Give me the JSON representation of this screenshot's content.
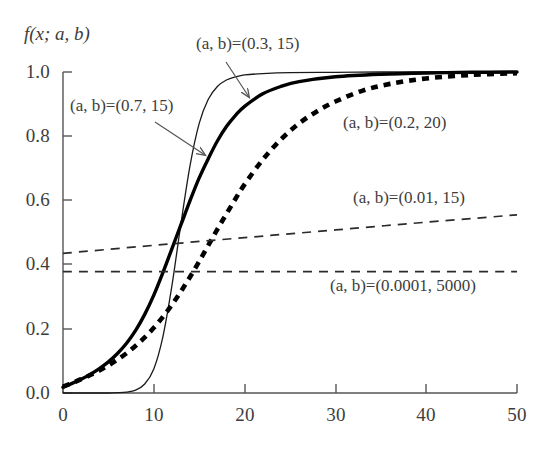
{
  "chart_data": {
    "type": "line",
    "title": "",
    "ylabel": "f(x; a, b)",
    "xlabel": "",
    "xlim": [
      0,
      50
    ],
    "ylim": [
      0.0,
      1.0
    ],
    "grid": false,
    "legend_position": "inline-annotations",
    "xticks": [
      "0",
      "10",
      "20",
      "30",
      "40",
      "50"
    ],
    "xtick_values": [
      0,
      10,
      20,
      30,
      40,
      50
    ],
    "yticks": [
      "0.0",
      "0.2",
      "0.4",
      "0.6",
      "0.8",
      "1.0"
    ],
    "ytick_values": [
      0.0,
      0.2,
      0.4,
      0.6,
      0.8,
      1.0
    ],
    "series": [
      {
        "name": "(a, b)=(0.7, 15)",
        "style": "thin-solid",
        "color": "#1a1a1a",
        "a": 0.7,
        "b": 15,
        "x": [
          0,
          1,
          2,
          3,
          4,
          5,
          6,
          7,
          8,
          9,
          10,
          11,
          12,
          13,
          14,
          15,
          16,
          17,
          18,
          19,
          20,
          22,
          25,
          30,
          35,
          40,
          45,
          50
        ],
        "y": [
          0.0,
          0.0,
          0.0,
          0.0,
          0.0,
          0.0,
          0.001,
          0.003,
          0.009,
          0.028,
          0.075,
          0.175,
          0.335,
          0.53,
          0.71,
          0.84,
          0.915,
          0.955,
          0.975,
          0.985,
          0.991,
          0.995,
          0.998,
          0.999,
          1.0,
          1.0,
          1.0,
          1.0
        ]
      },
      {
        "name": "(a, b)=(0.3, 15)",
        "style": "thick-solid",
        "color": "#000000",
        "a": 0.3,
        "b": 15,
        "x": [
          0,
          1,
          2,
          3,
          4,
          5,
          6,
          7,
          8,
          9,
          10,
          11,
          12,
          13,
          14,
          15,
          16,
          17,
          18,
          19,
          20,
          22,
          24,
          26,
          30,
          35,
          40,
          45,
          50
        ],
        "y": [
          0.018,
          0.03,
          0.043,
          0.058,
          0.076,
          0.097,
          0.123,
          0.155,
          0.195,
          0.245,
          0.305,
          0.375,
          0.45,
          0.525,
          0.6,
          0.67,
          0.73,
          0.785,
          0.83,
          0.865,
          0.893,
          0.932,
          0.955,
          0.97,
          0.985,
          0.993,
          0.997,
          0.999,
          1.0
        ]
      },
      {
        "name": "(a, b)=(0.2, 20)",
        "style": "thick-dashed",
        "color": "#000000",
        "a": 0.2,
        "b": 20,
        "x": [
          0,
          1,
          2,
          3,
          4,
          5,
          6,
          7,
          8,
          9,
          10,
          11,
          12,
          13,
          14,
          15,
          16,
          17,
          18,
          19,
          20,
          22,
          24,
          26,
          28,
          30,
          33,
          36,
          40,
          45,
          50
        ],
        "y": [
          0.02,
          0.031,
          0.043,
          0.056,
          0.07,
          0.086,
          0.104,
          0.124,
          0.147,
          0.173,
          0.203,
          0.237,
          0.275,
          0.317,
          0.362,
          0.41,
          0.46,
          0.51,
          0.558,
          0.605,
          0.65,
          0.727,
          0.79,
          0.84,
          0.878,
          0.908,
          0.942,
          0.963,
          0.98,
          0.991,
          0.996
        ]
      },
      {
        "name": "(a, b)=(0.01, 15)",
        "style": "thin-dashed",
        "color": "#2b2b2b",
        "a": 0.01,
        "b": 15,
        "x": [
          0,
          10,
          20,
          30,
          40,
          50
        ],
        "y": [
          0.435,
          0.46,
          0.484,
          0.508,
          0.532,
          0.555
        ]
      },
      {
        "name": "(a, b)=(0.0001, 5000)",
        "style": "thin-dashed",
        "color": "#2b2b2b",
        "a": 0.0001,
        "b": 5000,
        "x": [
          0,
          10,
          20,
          30,
          40,
          50
        ],
        "y": [
          0.378,
          0.378,
          0.378,
          0.378,
          0.378,
          0.378
        ]
      }
    ],
    "annotations": [
      {
        "id": "ann-07-15",
        "text": "(a, b)=(0.7, 15)",
        "label_x_px": 70,
        "label_y_px": 96,
        "arrow": {
          "x1": 155,
          "y1": 122,
          "x2": 205,
          "y2": 155
        }
      },
      {
        "id": "ann-03-15",
        "text": "(a, b)=(0.3, 15)",
        "label_x_px": 196,
        "label_y_px": 34,
        "arrow": {
          "x1": 226,
          "y1": 62,
          "x2": 249,
          "y2": 97
        }
      },
      {
        "id": "ann-02-20",
        "text": "(a, b)=(0.2, 20)",
        "label_x_px": 343,
        "label_y_px": 113,
        "arrow": null
      },
      {
        "id": "ann-001-15",
        "text": "(a, b)=(0.01, 15)",
        "label_x_px": 353,
        "label_y_px": 188,
        "arrow": null
      },
      {
        "id": "ann-00001-5000",
        "text": "(a, b)=(0.0001, 5000)",
        "label_x_px": 330,
        "label_y_px": 276,
        "arrow": null
      }
    ]
  },
  "axes": {
    "y_axis_title": "f(x; a, b)",
    "ytick_0": "0.0",
    "ytick_1": "0.2",
    "ytick_2": "0.4",
    "ytick_3": "0.6",
    "ytick_4": "0.8",
    "ytick_5": "1.0",
    "xtick_0": "0",
    "xtick_1": "10",
    "xtick_2": "20",
    "xtick_3": "30",
    "xtick_4": "40",
    "xtick_5": "50"
  },
  "labels": {
    "s1": "(a, b)=(0.7, 15)",
    "s2": "(a, b)=(0.3, 15)",
    "s3": "(a, b)=(0.2, 20)",
    "s4": "(a, b)=(0.01, 15)",
    "s5": "(a, b)=(0.0001, 5000)"
  },
  "colors": {
    "background": "#ffffff",
    "axis": "#555555",
    "curve_dark": "#000000",
    "curve_gray": "#2b2b2b",
    "text": "#3d3d3d"
  }
}
